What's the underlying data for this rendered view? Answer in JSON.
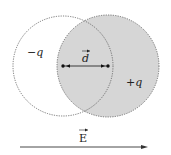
{
  "diagram": {
    "labels": {
      "neg_charge": "−q",
      "pos_charge": "+q",
      "dipole": "d",
      "field": "E"
    },
    "colors": {
      "shaded": "#d6d6d6",
      "stroke": "#555555",
      "text": "#222222"
    }
  }
}
